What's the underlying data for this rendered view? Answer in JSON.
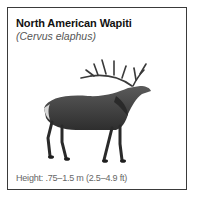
{
  "card": {
    "title": "North American Wapiti",
    "subtitle": "(Cervus elaphus)",
    "illustration": "elk-illustration",
    "caption": "Height: .75–1.5 m (2.5–4.9 ft)"
  },
  "colors": {
    "border": "#3a3a3a",
    "title": "#111111",
    "subtitle": "#555555",
    "caption": "#666666",
    "animal_body": "#4a4a4a",
    "animal_dark": "#2a2a2a"
  }
}
